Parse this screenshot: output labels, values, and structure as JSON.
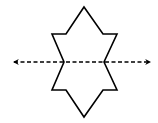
{
  "diagram": {
    "colors": {
      "background": "#ffffff",
      "stroke": "#000000"
    },
    "shape": {
      "type": "polygon",
      "points": "84,7 103,34 117,34 104,62 117,90 103,90 84,117 66,90 52,90 64,62 52,34 66,34",
      "stroke_width": 1.6
    },
    "symmetry_line": {
      "orientation": "horizontal",
      "style": "dashed",
      "x1": 14,
      "y1": 62,
      "x2": 150,
      "y2": 62,
      "dash": "4,2.5",
      "stroke_width": 1.4,
      "arrowheads": [
        "left",
        "right"
      ]
    }
  }
}
